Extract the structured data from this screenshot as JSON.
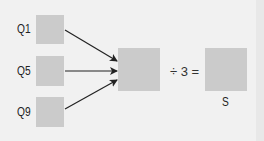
{
  "diagram": {
    "inputs": [
      {
        "id": "q1",
        "label": "Q1"
      },
      {
        "id": "q5",
        "label": "Q5"
      },
      {
        "id": "q9",
        "label": "Q9"
      }
    ],
    "operator": "÷ 3 =",
    "result": {
      "label": "S"
    },
    "colors": {
      "background": "#f1f1f1",
      "box_fill": "#cbcbcb",
      "arrow": "#222222",
      "text": "#222222"
    }
  }
}
